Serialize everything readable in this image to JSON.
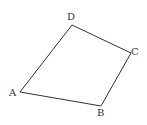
{
  "figure": {
    "type": "quadrilateral",
    "vertices": [
      {
        "name": "A",
        "x": 20,
        "y": 92,
        "label_x": 9,
        "label_y": 96
      },
      {
        "name": "B",
        "x": 101,
        "y": 106,
        "label_x": 97,
        "label_y": 116
      },
      {
        "name": "C",
        "x": 131,
        "y": 53,
        "label_x": 131,
        "label_y": 55
      },
      {
        "name": "D",
        "x": 72,
        "y": 25,
        "label_x": 67,
        "label_y": 20
      }
    ],
    "edges": [
      "AB",
      "BC",
      "CD",
      "DA"
    ],
    "line_color": "#333333",
    "background": "#ffffff"
  }
}
